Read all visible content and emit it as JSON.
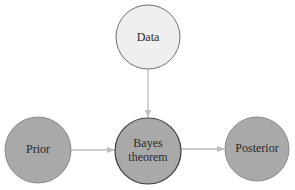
{
  "diagram": {
    "type": "flow",
    "background": "#ffffff",
    "edge_color": "#bdbdbd",
    "nodes": {
      "data": {
        "label": "Data",
        "cx": 148,
        "cy": 37,
        "r": 32,
        "fill": "#efefef",
        "stroke": "#6e6e6e"
      },
      "bayes": {
        "label_line1": "Bayes",
        "label_line2": "theorem",
        "cx": 148,
        "cy": 151,
        "r": 33,
        "fill": "#a9a9a9",
        "stroke": "#3c3c3c"
      },
      "prior": {
        "label": "Prior",
        "cx": 38,
        "cy": 150,
        "r": 33,
        "fill": "#a9a9a9",
        "stroke": "#8a8a8a"
      },
      "posterior": {
        "label": "Posterior",
        "cx": 257,
        "cy": 149,
        "r": 32,
        "fill": "#a9a9a9",
        "stroke": "#8a8a8a"
      }
    },
    "edges": [
      {
        "from": "Data",
        "to": "Bayes theorem"
      },
      {
        "from": "Prior",
        "to": "Bayes theorem"
      },
      {
        "from": "Bayes theorem",
        "to": "Posterior"
      }
    ]
  }
}
